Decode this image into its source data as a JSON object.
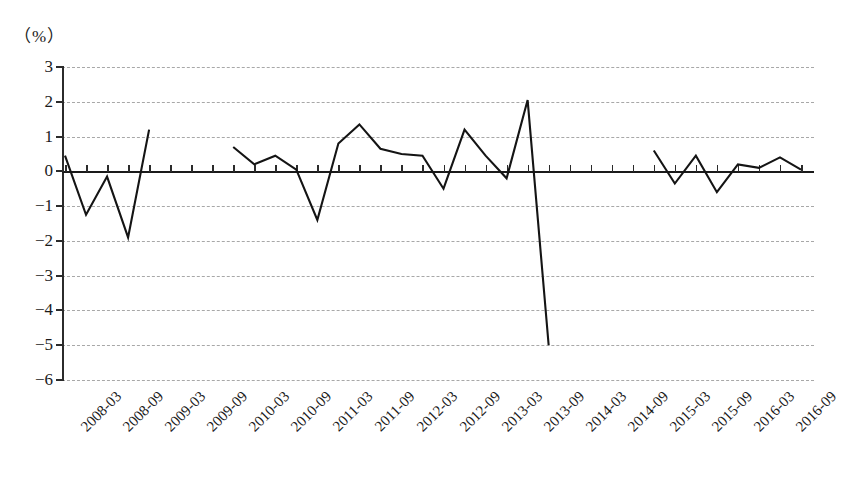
{
  "chart_data": {
    "type": "line",
    "title": "",
    "subtitle": "",
    "unit_label": "（%）",
    "ylabel": "",
    "xlabel": "（时间）",
    "ylim": [
      -6,
      3
    ],
    "ytick_step": 1,
    "yticks": [
      "3",
      "2",
      "1",
      "0",
      "−1",
      "−2",
      "−3",
      "−4",
      "−5",
      "−6"
    ],
    "ytick_values": [
      3,
      2,
      1,
      0,
      -1,
      -2,
      -3,
      -4,
      -5,
      -6
    ],
    "grid": "horizontal-dashed",
    "zero_line": true,
    "legend": "none",
    "xtick_labels": [
      "2008-03",
      "2008-09",
      "2009-03",
      "2009-09",
      "2010-03",
      "2010-09",
      "2011-03",
      "2011-09",
      "2012-03",
      "2012-09",
      "2013-03",
      "2013-09",
      "2014-03",
      "2014-09",
      "2015-03",
      "2015-09",
      "2016-03",
      "2016-09"
    ],
    "xtick_label_interval_months": 6,
    "x_start": "2008-03",
    "x_end": "2016-12",
    "line_color": "#141414",
    "gridline_color": "#a8a8a8",
    "series": [
      {
        "name": "增长率",
        "has_gaps": true,
        "x": [
          "2008-03",
          "2008-06",
          "2008-09",
          "2008-12",
          "2009-03",
          "2009-06",
          "2009-09",
          "2010-03",
          "2010-06",
          "2010-09",
          "2010-12",
          "2011-03",
          "2011-06",
          "2011-09",
          "2011-12",
          "2012-03",
          "2012-06",
          "2012-09",
          "2012-12",
          "2013-03",
          "2013-06",
          "2013-09",
          "2013-12",
          "2014-03",
          "2014-06",
          "2015-03",
          "2015-06",
          "2015-09",
          "2015-12",
          "2016-03",
          "2016-06",
          "2016-09",
          "2016-12"
        ],
        "values": [
          0.45,
          -1.25,
          -0.15,
          -1.9,
          1.2,
          null,
          null,
          0.7,
          0.2,
          0.45,
          0.05,
          -1.4,
          0.8,
          1.35,
          0.65,
          0.5,
          0.45,
          -0.5,
          1.2,
          0.45,
          -0.2,
          2.05,
          -5.0,
          null,
          null,
          0.6,
          -0.35,
          0.45,
          -0.6,
          0.2,
          0.1,
          0.4,
          0.05
        ]
      }
    ],
    "data_points": [
      {
        "x": "2008-03",
        "y": 0.45
      },
      {
        "x": "2008-06",
        "y": -1.25
      },
      {
        "x": "2008-09",
        "y": -0.15
      },
      {
        "x": "2008-12",
        "y": -1.9
      },
      {
        "x": "2009-03",
        "y": 1.2
      },
      {
        "x": "2010-03",
        "y": 0.7
      },
      {
        "x": "2010-06",
        "y": 0.7
      },
      {
        "x": "2010-09",
        "y": 0.2
      },
      {
        "x": "2010-12",
        "y": 0.45
      },
      {
        "x": "2011-03",
        "y": 0.05
      },
      {
        "x": "2011-06",
        "y": -1.4
      },
      {
        "x": "2011-09",
        "y": 0.8
      },
      {
        "x": "2011-12",
        "y": 1.35
      },
      {
        "x": "2012-03",
        "y": 0.65
      },
      {
        "x": "2012-06",
        "y": 0.5
      },
      {
        "x": "2012-09",
        "y": 0.45
      },
      {
        "x": "2012-12",
        "y": -0.5
      },
      {
        "x": "2013-03",
        "y": 1.2
      },
      {
        "x": "2013-06",
        "y": 0.45
      },
      {
        "x": "2013-09",
        "y": -0.2
      },
      {
        "x": "2013-12",
        "y": 2.05
      },
      {
        "x": "2014-03",
        "y": -5.0
      },
      {
        "x": "2015-03",
        "y": 0.6
      },
      {
        "x": "2015-06",
        "y": -0.35
      },
      {
        "x": "2015-09",
        "y": 0.45
      },
      {
        "x": "2015-12",
        "y": -0.6
      },
      {
        "x": "2016-03",
        "y": 0.2
      },
      {
        "x": "2016-06",
        "y": 0.1
      },
      {
        "x": "2016-09",
        "y": 0.4
      },
      {
        "x": "2016-12",
        "y": 0.05
      }
    ],
    "annotations": {
      "max_value": 2.05,
      "min_value": -5.0
    }
  }
}
